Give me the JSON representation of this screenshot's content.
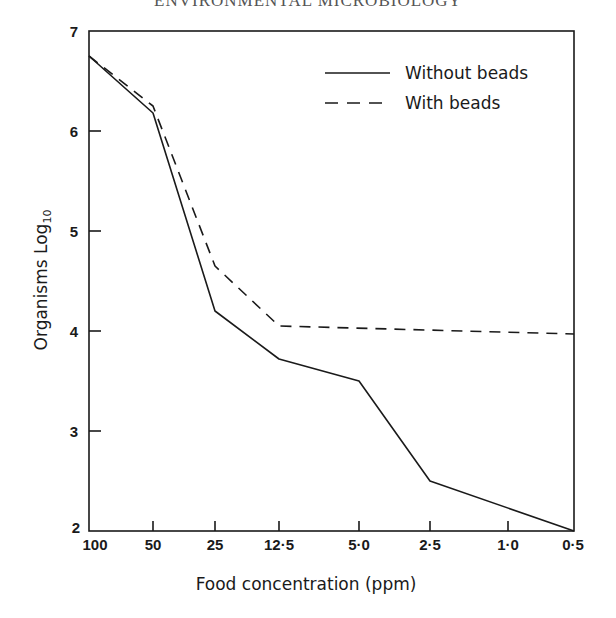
{
  "page_header": "ENVIRONMENTAL MICROBIOLOGY",
  "chart_data": {
    "type": "line",
    "title": "",
    "xlabel": "Food concentration (ppm)",
    "ylabel": "Organisms Log10",
    "categories": [
      "100",
      "50",
      "25",
      "12·5",
      "5·0",
      "2·5",
      "1·0",
      "0·5"
    ],
    "y_ticks": [
      "2",
      "3",
      "4",
      "5",
      "6",
      "7"
    ],
    "ylim": [
      2,
      7
    ],
    "grid": false,
    "legend_position": "upper right",
    "series": [
      {
        "name": "Without beads",
        "style": "solid",
        "x": [
          "100",
          "50",
          "25",
          "12·5",
          "5·0",
          "2·5",
          "0·5"
        ],
        "values": [
          6.75,
          6.18,
          4.2,
          3.72,
          3.5,
          2.5,
          2.0
        ]
      },
      {
        "name": "With beads",
        "style": "dashed",
        "x": [
          "100",
          "50",
          "25",
          "12·5",
          "0·5"
        ],
        "values": [
          6.75,
          6.25,
          4.65,
          4.05,
          3.97
        ]
      }
    ]
  },
  "labels": {
    "ylabel_main": "Organisms Log",
    "ylabel_sub": "10",
    "legend_solid": "Without beads",
    "legend_dashed": "With beads"
  }
}
